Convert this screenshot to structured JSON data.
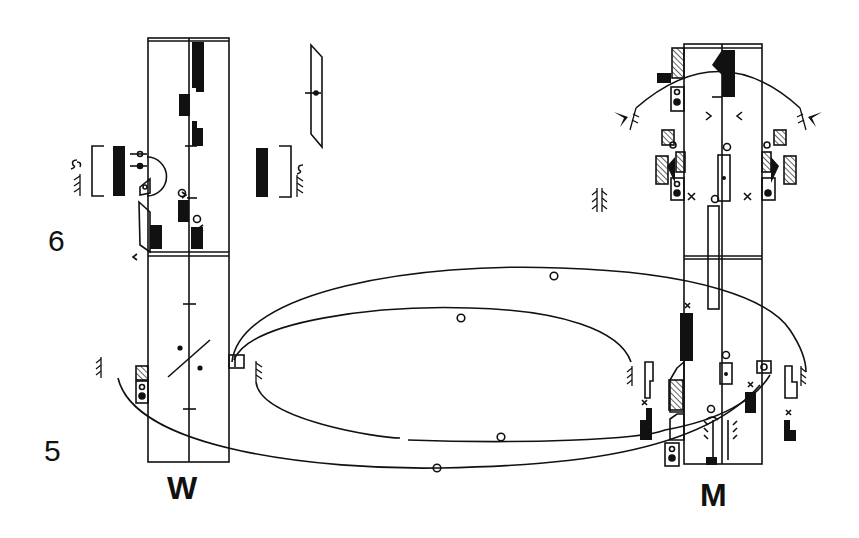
{
  "diagram": {
    "type": "dance notation score (Labanotation)",
    "staffs": [
      {
        "id": "W",
        "label": "W"
      },
      {
        "id": "M",
        "label": "M"
      }
    ],
    "measures": [
      {
        "number": "6"
      },
      {
        "number": "5"
      }
    ],
    "paths": {
      "count": 4,
      "markers": [
        "circle",
        "circle",
        "circle",
        "circle"
      ]
    },
    "colors": {
      "ink": "#111111",
      "paper": "#ffffff"
    }
  }
}
